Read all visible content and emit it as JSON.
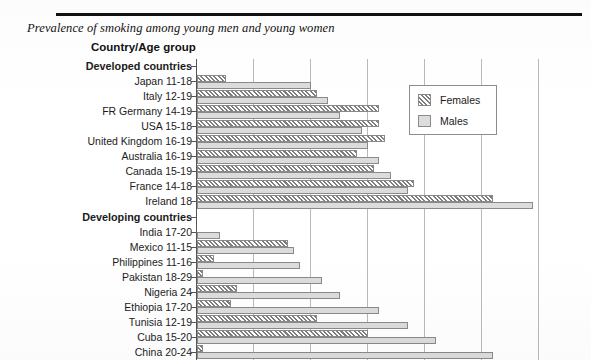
{
  "document": {
    "title": "Prevalence of smoking among young men and young women",
    "axis_title": "Country/Age group"
  },
  "legend": {
    "position": "inside-right-top",
    "items": [
      {
        "label": "Females",
        "swatch": "diagonal-hatch-swatch",
        "color": "#d9d9d9"
      },
      {
        "label": "Males",
        "swatch": "solid-gray-swatch",
        "color": "#dcdcdc"
      }
    ]
  },
  "chart_data": {
    "type": "bar",
    "orientation": "horizontal",
    "title": "Prevalence of smoking among young men and young women",
    "xlabel": "",
    "ylabel": "Country/Age group",
    "xlim": [
      0,
      68
    ],
    "gridlines": [
      0,
      10,
      20,
      30,
      40,
      50,
      60
    ],
    "grid": true,
    "categories": [
      "Developed countries",
      "Japan 11-18",
      "Italy 12-19",
      "FR Germany 14-19",
      "USA 15-18",
      "United Kingdom 16-19",
      "Australia 16-19",
      "Canada 15-19",
      "France 14-18",
      "Ireland        18",
      "Developing countries",
      "India 17-20",
      "Mexico 11-15",
      "Philippines 11-16",
      "Pakistan 18-29",
      "Nigeria        24",
      "Ethiopia 17-20",
      "Tunisia 12-19",
      "Cuba 15-20",
      "China 20-24"
    ],
    "group_headers": [
      "Developed countries",
      "Developing countries"
    ],
    "series": [
      {
        "name": "Females",
        "pattern": "diagonal-hatch",
        "values": [
          null,
          5,
          21,
          32,
          32,
          33,
          28,
          31,
          38,
          52,
          null,
          0,
          16,
          3,
          1,
          7,
          6,
          21,
          30,
          1
        ]
      },
      {
        "name": "Males",
        "pattern": "solid-gray",
        "values": [
          null,
          20,
          23,
          25,
          29,
          30,
          32,
          34,
          37,
          59,
          null,
          4,
          17,
          18,
          22,
          25,
          32,
          37,
          42,
          52
        ]
      }
    ]
  }
}
